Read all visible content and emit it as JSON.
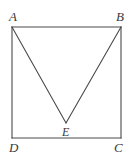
{
  "figure": {
    "background_color": "#ffffff",
    "stroke_color": "#4a4a4a",
    "stroke_width": 1.1,
    "labels": {
      "a": "A",
      "b": "B",
      "c": "C",
      "d": "D",
      "e": "E"
    },
    "points": {
      "A": {
        "x": 12,
        "y": 27
      },
      "B": {
        "x": 121,
        "y": 27
      },
      "C": {
        "x": 121,
        "y": 138
      },
      "D": {
        "x": 12,
        "y": 138
      },
      "E": {
        "x": 66,
        "y": 123
      }
    },
    "segments": [
      {
        "name": "side-AB",
        "from": "A",
        "to": "B"
      },
      {
        "name": "side-BC",
        "from": "B",
        "to": "C"
      },
      {
        "name": "side-CD",
        "from": "C",
        "to": "D"
      },
      {
        "name": "side-DA",
        "from": "D",
        "to": "A"
      },
      {
        "name": "segment-AE",
        "from": "A",
        "to": "E"
      },
      {
        "name": "segment-BE",
        "from": "B",
        "to": "E"
      }
    ]
  }
}
